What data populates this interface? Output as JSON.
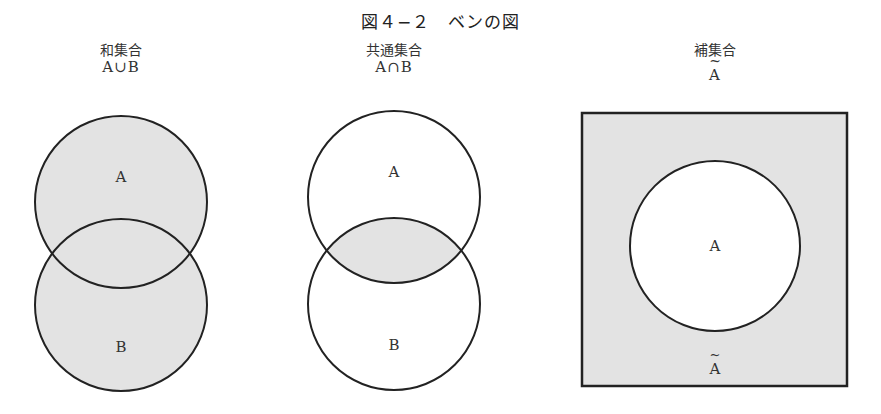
{
  "figure": {
    "title": "図４−２　ベンの図"
  },
  "colors": {
    "shade": "#e3e3e3",
    "stroke": "#222222",
    "background": "#ffffff"
  },
  "diagrams": [
    {
      "name": "union",
      "caption": "和集合",
      "expression": "A∪B",
      "sets": [
        "A",
        "B"
      ],
      "shaded_region": "A or B"
    },
    {
      "name": "intersection",
      "caption": "共通集合",
      "expression": "A∩B",
      "sets": [
        "A",
        "B"
      ],
      "shaded_region": "A and B"
    },
    {
      "name": "complement",
      "caption": "補集合",
      "expression_tilde": "~",
      "expression": "A",
      "sets": [
        "A"
      ],
      "outside_label_tilde": "~",
      "outside_label": "A",
      "shaded_region": "not A"
    }
  ]
}
